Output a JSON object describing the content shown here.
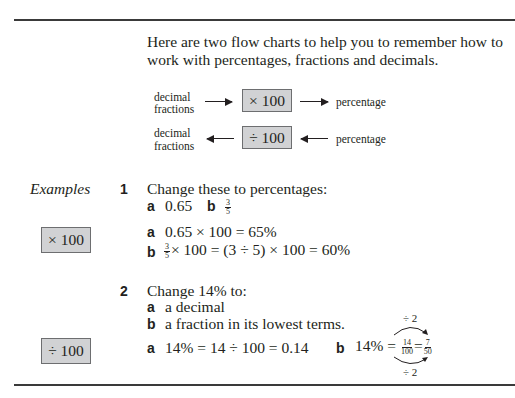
{
  "intro": {
    "line1": "Here are two flow charts to help you to remember how to",
    "line2": "work with percentages, fractions and decimals."
  },
  "flowcharts": [
    {
      "left_line1": "decimal",
      "left_line2": "fractions",
      "operation": "× 100",
      "right": "percentage",
      "direction": "right"
    },
    {
      "left_line1": "decimal",
      "left_line2": "fractions",
      "operation": "÷ 100",
      "right": "percentage",
      "direction": "left"
    }
  ],
  "sidebar": {
    "heading": "Examples",
    "box1": "× 100",
    "box2": "÷ 100"
  },
  "example1": {
    "number": "1",
    "question": "Change these to percentages:",
    "parts": [
      {
        "label": "a",
        "text": "0.65"
      },
      {
        "label": "b",
        "frac_num": "3",
        "frac_den": "5"
      }
    ],
    "answers": [
      {
        "label": "a",
        "text": "0.65 × 100 = 65%"
      },
      {
        "label": "b",
        "frac_num": "3",
        "frac_den": "5",
        "text": "× 100 = (3 ÷ 5) × 100 = 60%"
      }
    ]
  },
  "example2": {
    "number": "2",
    "question": "Change 14% to:",
    "parts": [
      {
        "label": "a",
        "text": "a decimal"
      },
      {
        "label": "b",
        "text": "a fraction in its lowest terms."
      }
    ],
    "answers": [
      {
        "label": "a",
        "text": "14% = 14 ÷ 100 = 0.14"
      },
      {
        "label": "b",
        "prefix": "14% =",
        "frac1_num": "14",
        "frac1_den": "100",
        "equals": "=",
        "frac2_num": "7",
        "frac2_den": "50",
        "top_note": "÷ 2",
        "bottom_note": "÷ 2"
      }
    ]
  }
}
